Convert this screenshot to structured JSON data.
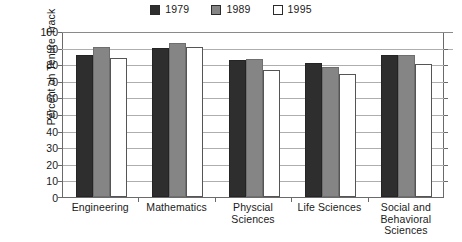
{
  "chart_data": {
    "type": "bar",
    "title": "",
    "subtitle": "",
    "xlabel": "",
    "ylabel": "Percent on Tenure Track",
    "ylim": [
      0,
      100
    ],
    "ytick_step": 10,
    "yticks": [
      "100",
      "90",
      "80",
      "70",
      "60",
      "50",
      "40",
      "30",
      "20",
      "10",
      "0"
    ],
    "grid": "horizontal",
    "legend_position": "top-center",
    "categories": [
      "Engineering",
      "Mathematics",
      "Physcial Sciences",
      "Life Sciences",
      "Social and Behavioral Sciences"
    ],
    "series": [
      {
        "name": "1979",
        "color": "#2e2e2e",
        "values": [
          85.5,
          89.5,
          82.5,
          81.0,
          85.5
        ]
      },
      {
        "name": "1989",
        "color": "#858585",
        "values": [
          90.5,
          93.0,
          83.0,
          78.5,
          85.5
        ]
      },
      {
        "name": "1995",
        "color": "#ffffff",
        "values": [
          83.5,
          90.5,
          76.5,
          74.0,
          80.0
        ]
      }
    ]
  },
  "legend": {
    "entries": [
      {
        "label": "1979",
        "swatch": "#2e2e2e"
      },
      {
        "label": "1989",
        "swatch": "#858585"
      },
      {
        "label": "1995",
        "swatch": "#ffffff"
      }
    ]
  },
  "axes": {
    "y_title": "Percent on Tenure Track",
    "y_ticks": [
      "100",
      "90",
      "80",
      "70",
      "60",
      "50",
      "40",
      "30",
      "20",
      "10",
      "0"
    ],
    "x_categories": [
      {
        "lines": [
          "Engineering"
        ]
      },
      {
        "lines": [
          "Mathematics"
        ]
      },
      {
        "lines": [
          "Physcial",
          "Sciences"
        ]
      },
      {
        "lines": [
          "Life Sciences"
        ]
      },
      {
        "lines": [
          "Social and",
          "Behavioral",
          "Sciences"
        ]
      }
    ]
  },
  "colors": {
    "series_1979": "#2e2e2e",
    "series_1989": "#858585",
    "series_1995": "#ffffff",
    "gridline": "#aeaeae",
    "axis": "#6a6a6a",
    "text": "#1a1a1a",
    "background": "#ffffff"
  }
}
